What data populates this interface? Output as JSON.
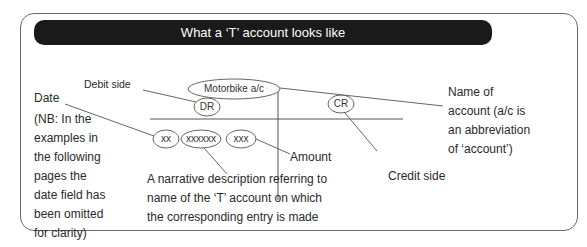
{
  "title": "What a ‘T’ account looks like",
  "account": {
    "name": "Motorbike a/c",
    "debit": "DR",
    "credit": "CR"
  },
  "entry": {
    "date": "xx",
    "narrative": "xxxxxx",
    "amount": "xxx"
  },
  "labels": {
    "debit_side": "Debit side",
    "credit_side": "Credit side",
    "date": "Date",
    "amount": "Amount",
    "name_of_account": [
      "Name of",
      "account (a/c is",
      "an abbreviation",
      "of ‘account’)"
    ],
    "date_note": [
      "(NB: In the",
      "examples in",
      "the following",
      "pages the",
      "date field has",
      "been omitted",
      "for clarity)"
    ],
    "narrative_note": [
      "A narrative description referring to",
      "name of the ‘T’ account on which",
      "the corresponding entry is made"
    ]
  }
}
